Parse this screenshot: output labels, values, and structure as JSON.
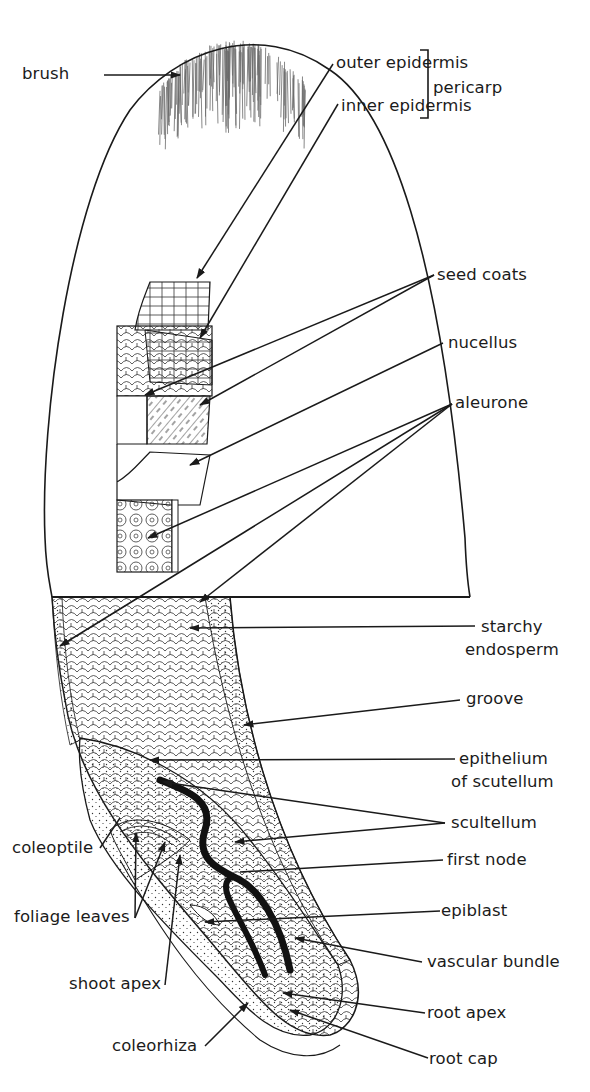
{
  "figure": {
    "labels": {
      "brush": "brush",
      "outer_epidermis": "outer epidermis",
      "inner_epidermis": "inner epidermis",
      "pericarp": "pericarp",
      "seed_coats": "seed coats",
      "nucellus": "nucellus",
      "aleurone": "aleurone",
      "starchy_endosperm_1": "starchy",
      "starchy_endosperm_2": "endosperm",
      "groove": "groove",
      "epithelium_1": "epithelium",
      "epithelium_2": "of scutellum",
      "scutellum": "scultellum",
      "first_node": "first node",
      "epiblast": "epiblast",
      "vascular_bundle": "vascular bundle",
      "root_apex": "root apex",
      "root_cap": "root cap",
      "coleoptile": "coleoptile",
      "foliage_leaves": "foliage leaves",
      "shoot_apex": "shoot apex",
      "coleorhiza": "coleorhiza"
    },
    "colors": {
      "ink": "#1a1a1a",
      "paper": "#ffffff",
      "hair": "#6a6a6a"
    }
  }
}
